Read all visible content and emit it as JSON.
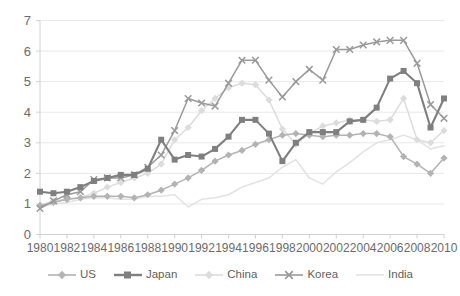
{
  "chart_data": {
    "type": "line",
    "title": "",
    "xlabel": "",
    "ylabel": "",
    "xlim": [
      1980,
      2010
    ],
    "ylim": [
      0,
      7
    ],
    "ytick_step": 1,
    "xtick_step": 2,
    "grid": true,
    "legend_position": "bottom",
    "x": [
      1980,
      1981,
      1982,
      1983,
      1984,
      1985,
      1986,
      1987,
      1988,
      1989,
      1990,
      1991,
      1992,
      1993,
      1994,
      1995,
      1996,
      1997,
      1998,
      1999,
      2000,
      2001,
      2002,
      2003,
      2004,
      2005,
      2006,
      2007,
      2008,
      2009,
      2010
    ],
    "xticks": [
      "1980",
      "1982",
      "1984",
      "1986",
      "1988",
      "1990",
      "1992",
      "1994",
      "1996",
      "1998",
      "2000",
      "2002",
      "2004",
      "2006",
      "2008",
      "2010"
    ],
    "yticks": [
      "0",
      "1",
      "2",
      "3",
      "4",
      "5",
      "6",
      "7"
    ],
    "series": [
      {
        "name": "US",
        "color": "#b3b3b3",
        "marker": "diamond",
        "values": [
          0.95,
          1.05,
          1.15,
          1.2,
          1.25,
          1.25,
          1.25,
          1.2,
          1.3,
          1.45,
          1.65,
          1.85,
          2.1,
          2.4,
          2.6,
          2.75,
          2.95,
          3.1,
          3.25,
          3.3,
          3.25,
          3.2,
          3.25,
          3.25,
          3.3,
          3.3,
          3.2,
          2.55,
          2.3,
          2.0,
          2.5
        ]
      },
      {
        "name": "Japan",
        "color": "#7f7f7f",
        "marker": "square",
        "values": [
          1.4,
          1.35,
          1.4,
          1.55,
          1.75,
          1.85,
          1.95,
          1.95,
          2.15,
          3.1,
          2.45,
          2.6,
          2.55,
          2.8,
          3.2,
          3.75,
          3.75,
          3.3,
          2.4,
          3.0,
          3.35,
          3.35,
          3.35,
          3.7,
          3.75,
          4.15,
          5.1,
          5.35,
          4.95,
          3.5,
          4.45
        ]
      },
      {
        "name": "China",
        "color": "#dcdcdc",
        "marker": "diamond",
        "values": [
          0.95,
          1.1,
          1.15,
          1.2,
          1.35,
          1.55,
          1.7,
          1.85,
          2.0,
          2.3,
          3.1,
          3.5,
          4.05,
          4.45,
          4.8,
          4.95,
          4.9,
          4.4,
          3.45,
          2.95,
          3.3,
          3.55,
          3.65,
          3.75,
          3.75,
          3.7,
          3.75,
          4.45,
          3.1,
          3.0,
          3.4
        ]
      },
      {
        "name": "Korea",
        "color": "#9a9a9a",
        "marker": "cross",
        "values": [
          0.85,
          1.1,
          1.3,
          1.4,
          1.8,
          1.85,
          1.85,
          1.95,
          2.2,
          2.6,
          3.4,
          4.45,
          4.3,
          4.2,
          4.95,
          5.7,
          5.7,
          5.05,
          4.5,
          5.0,
          5.4,
          5.05,
          6.05,
          6.05,
          6.2,
          6.3,
          6.35,
          6.35,
          5.6,
          4.25,
          3.8
        ]
      },
      {
        "name": "India",
        "color": "#e2e2e2",
        "marker": "none",
        "values": [
          0.9,
          1.0,
          1.05,
          1.15,
          1.2,
          1.2,
          1.15,
          1.15,
          1.25,
          1.25,
          1.3,
          0.9,
          1.15,
          1.2,
          1.3,
          1.55,
          1.7,
          1.85,
          2.2,
          2.45,
          1.85,
          1.65,
          2.05,
          2.35,
          2.7,
          3.0,
          3.1,
          3.25,
          3.1,
          2.8,
          2.9
        ]
      }
    ]
  },
  "legend": {
    "items": [
      {
        "label": "US",
        "color": "#b3b3b3",
        "marker": "diamond"
      },
      {
        "label": "Japan",
        "color": "#7f7f7f",
        "marker": "square"
      },
      {
        "label": "China",
        "color": "#dcdcdc",
        "marker": "diamond"
      },
      {
        "label": "Korea",
        "color": "#9a9a9a",
        "marker": "cross"
      },
      {
        "label": "India",
        "color": "#e2e2e2",
        "marker": "none"
      }
    ]
  },
  "colors": {
    "grid": "#e8e8e8",
    "axis": "#d0d0d0",
    "tick_text": "#6b6b6b",
    "background": "#ffffff"
  }
}
